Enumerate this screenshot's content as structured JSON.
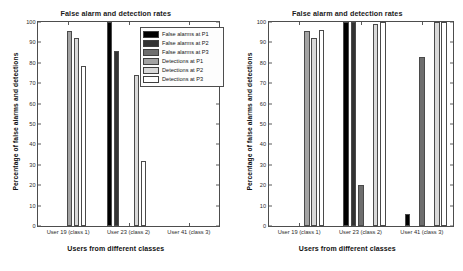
{
  "figure": {
    "panels": [
      {
        "id": "left",
        "title": "False alarm and detection rates",
        "xlabel": "Users from different classes",
        "ylabel": "Percentage of false alarms and detections",
        "has_legend": true
      },
      {
        "id": "right",
        "title": "False alarm and detection rates",
        "xlabel": "Users from different classes",
        "ylabel": "Percentage of false alarms and detections",
        "has_legend": false
      }
    ]
  },
  "legend": {
    "entries": [
      {
        "label": "False alarms at P1",
        "color": "#000000"
      },
      {
        "label": "False alarms at P2",
        "color": "#333333"
      },
      {
        "label": "False alarms at P3",
        "color": "#6e6e6e"
      },
      {
        "label": "Detections at P1",
        "color": "#a3a3a3"
      },
      {
        "label": "Detections at P2",
        "color": "#d9d9d9"
      },
      {
        "label": "Detections at P3",
        "color": "#ffffff"
      }
    ]
  },
  "yticks": [
    "0",
    "10",
    "20",
    "30",
    "40",
    "50",
    "60",
    "70",
    "80",
    "90",
    "100"
  ],
  "chart_data": [
    {
      "type": "bar",
      "title": "False alarm and detection rates",
      "xlabel": "Users from different classes",
      "ylabel": "Percentage of false alarms and detections",
      "ylim": [
        0,
        100
      ],
      "grid": false,
      "legend_position": "upper right",
      "categories": [
        "User 19 (class 1)",
        "User 23 (class 2)",
        "User 41 (class 3)"
      ],
      "series": [
        {
          "name": "False alarms at P1",
          "color": "#000000",
          "values": [
            0,
            100,
            0
          ]
        },
        {
          "name": "False alarms at P2",
          "color": "#333333",
          "values": [
            0,
            86,
            0
          ]
        },
        {
          "name": "False alarms at P3",
          "color": "#6e6e6e",
          "values": [
            0,
            0,
            0
          ]
        },
        {
          "name": "Detections at P1",
          "color": "#a3a3a3",
          "values": [
            95.5,
            0,
            0
          ]
        },
        {
          "name": "Detections at P2",
          "color": "#d9d9d9",
          "values": [
            92,
            74,
            0
          ]
        },
        {
          "name": "Detections at P3",
          "color": "#ffffff",
          "values": [
            78.5,
            32,
            0
          ]
        }
      ]
    },
    {
      "type": "bar",
      "title": "False alarm and detection rates",
      "xlabel": "Users from different classes",
      "ylabel": "Percentage of false alarms and detections",
      "ylim": [
        0,
        100
      ],
      "grid": false,
      "legend_position": "none",
      "categories": [
        "User 19 (class 1)",
        "User 23 (class 2)",
        "User 41 (class 3)"
      ],
      "series": [
        {
          "name": "False alarms at P1",
          "color": "#000000",
          "values": [
            0,
            100,
            6
          ]
        },
        {
          "name": "False alarms at P2",
          "color": "#333333",
          "values": [
            0,
            100,
            0
          ]
        },
        {
          "name": "False alarms at P3",
          "color": "#6e6e6e",
          "values": [
            0,
            20,
            83
          ]
        },
        {
          "name": "Detections at P1",
          "color": "#a3a3a3",
          "values": [
            95.5,
            0,
            0
          ]
        },
        {
          "name": "Detections at P2",
          "color": "#d9d9d9",
          "values": [
            92,
            99,
            100
          ]
        },
        {
          "name": "Detections at P3",
          "color": "#ffffff",
          "values": [
            96,
            100,
            100
          ]
        }
      ]
    }
  ]
}
